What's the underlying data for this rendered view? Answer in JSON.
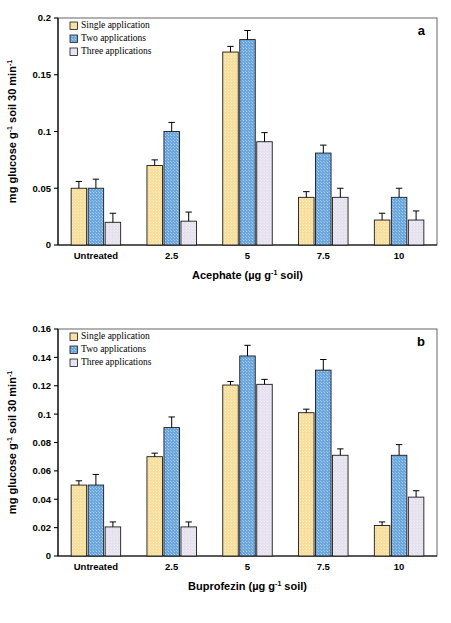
{
  "figure": {
    "panels": [
      "a",
      "b"
    ]
  },
  "legend": {
    "items": [
      {
        "label": "Single application",
        "color": "#F7DF9B",
        "key": "single"
      },
      {
        "label": "Two applications",
        "color": "#6BA6DC",
        "key": "two"
      },
      {
        "label": "Three applications",
        "color": "#E5E1EE",
        "key": "three"
      }
    ]
  },
  "panel_a": {
    "letter": "a",
    "y_title_main": "mg glucose g",
    "y_title_sup1": "-1",
    "y_title_mid": " soil 30 min",
    "y_title_sup2": "-1",
    "x_title_main": "Acephate (µg g",
    "x_title_sup": "-1",
    "x_title_tail": " soil)"
  },
  "panel_b": {
    "letter": "b",
    "y_title_main": "mg glucose g",
    "y_title_sup1": "-1",
    "y_title_mid": " soil 30 min",
    "y_title_sup2": "-1",
    "x_title_main": "Buprofezin (µg g",
    "x_title_sup": "-1",
    "x_title_tail": " soil)"
  },
  "chart_data": [
    {
      "type": "bar",
      "panel": "a",
      "title": "",
      "xlabel": "Acephate (µg g-1 soil)",
      "ylabel": "mg glucose g-1 soil 30 min-1",
      "categories": [
        "Untreated",
        "2.5",
        "5",
        "7.5",
        "10"
      ],
      "ylim": [
        0,
        0.2
      ],
      "yticks": [
        0,
        0.05,
        0.1,
        0.15,
        0.2
      ],
      "ytick_labels": [
        "0",
        "0.05",
        "0.1",
        "0.15",
        "0.2"
      ],
      "grid": false,
      "legend_position": "top-left",
      "series": [
        {
          "name": "Single application",
          "color": "#F7DF9B",
          "values": [
            0.05,
            0.07,
            0.17,
            0.042,
            0.022
          ],
          "errors": [
            0.006,
            0.005,
            0.005,
            0.005,
            0.006
          ]
        },
        {
          "name": "Two applications",
          "color": "#6BA6DC",
          "values": [
            0.05,
            0.1,
            0.181,
            0.081,
            0.042
          ],
          "errors": [
            0.008,
            0.008,
            0.008,
            0.007,
            0.008
          ]
        },
        {
          "name": "Three applications",
          "color": "#E5E1EE",
          "values": [
            0.02,
            0.021,
            0.091,
            0.042,
            0.022
          ],
          "errors": [
            0.008,
            0.008,
            0.008,
            0.008,
            0.008
          ]
        }
      ]
    },
    {
      "type": "bar",
      "panel": "b",
      "title": "",
      "xlabel": "Buprofezin (µg g-1 soil)",
      "ylabel": "mg glucose g-1 soil 30 min-1",
      "categories": [
        "Untreated",
        "2.5",
        "5",
        "7.5",
        "10"
      ],
      "ylim": [
        0,
        0.16
      ],
      "yticks": [
        0,
        0.02,
        0.04,
        0.06,
        0.08,
        0.1,
        0.12,
        0.14,
        0.16
      ],
      "ytick_labels": [
        "0",
        "0.02",
        "0.04",
        "0.06",
        "0.08",
        "0.1",
        "0.12",
        "0.14",
        "0.16"
      ],
      "grid": false,
      "legend_position": "top-left",
      "series": [
        {
          "name": "Single application",
          "color": "#F7DF9B",
          "values": [
            0.05,
            0.07,
            0.1205,
            0.101,
            0.0215
          ],
          "errors": [
            0.003,
            0.0025,
            0.0025,
            0.0025,
            0.0025
          ]
        },
        {
          "name": "Two applications",
          "color": "#6BA6DC",
          "values": [
            0.05,
            0.0905,
            0.141,
            0.131,
            0.071
          ],
          "errors": [
            0.0075,
            0.0075,
            0.0075,
            0.0075,
            0.0075
          ]
        },
        {
          "name": "Three applications",
          "color": "#E5E1EE",
          "values": [
            0.0205,
            0.0205,
            0.121,
            0.071,
            0.0415
          ],
          "errors": [
            0.0035,
            0.0035,
            0.0035,
            0.0045,
            0.0045
          ]
        }
      ]
    }
  ]
}
